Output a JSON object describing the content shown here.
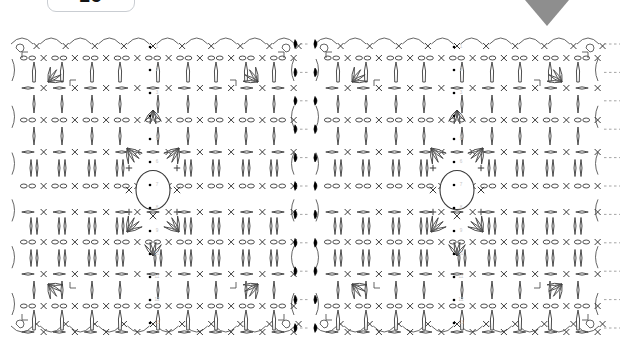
{
  "page": {
    "background_color": "#ffffff",
    "width": 620,
    "height": 343
  },
  "badge": {
    "name": "page-number-badge",
    "value": "25",
    "border_color": "#c9cdd2",
    "text_color": "#141414",
    "clipped_top": true
  },
  "marker": {
    "name": "down-triangle-marker",
    "shape": "triangle-down",
    "color": "#8e8e8e",
    "x": 503,
    "y": -26,
    "width": 88,
    "height": 52
  },
  "chart_data": {
    "type": "diagram",
    "title": "",
    "subtitle": "",
    "stroke_color": "#3a3a3a",
    "fill_color": "#ffffff",
    "accent_color": "#000000",
    "connector_color": "#9a9a9a",
    "row_label_color": "#c6c6c6",
    "panels": [
      {
        "name": "left-motif-panel",
        "x": 8,
        "y": 36,
        "width": 290,
        "height": 300,
        "center": {
          "x": 153,
          "y": 190,
          "ring_radius": 17
        },
        "rows": 13,
        "columns": 13
      },
      {
        "name": "right-motif-panel",
        "x": 312,
        "y": 36,
        "width": 290,
        "height": 300,
        "center": {
          "x": 457,
          "y": 190,
          "ring_radius": 17
        },
        "rows": 13,
        "columns": 13
      }
    ],
    "symbols": [
      {
        "key": "chain",
        "glyph": "oval",
        "label": "ch - chain stitch"
      },
      {
        "key": "single-crochet",
        "glyph": "x",
        "label": "sc - single crochet"
      },
      {
        "key": "slip-stitch",
        "glyph": "filled-dot",
        "label": "sl st - slip stitch"
      },
      {
        "key": "double-crochet",
        "glyph": "vertical-bar",
        "label": "dc - double crochet"
      },
      {
        "key": "treble-crochet",
        "glyph": "long-bar",
        "label": "tr - treble crochet"
      },
      {
        "key": "shell-cluster",
        "glyph": "fan",
        "label": "shell / cluster"
      },
      {
        "key": "picot-loop",
        "glyph": "arc",
        "label": "picot loop"
      },
      {
        "key": "magic-ring",
        "glyph": "circle",
        "label": "ring / centre circle"
      },
      {
        "key": "join-marker",
        "glyph": "corner",
        "label": "row join marker"
      }
    ],
    "row_labels": [
      "1",
      "2",
      "3",
      "4",
      "5",
      "6",
      "7",
      "8",
      "9",
      "10",
      "11",
      "12",
      "13"
    ],
    "legend_position": "none",
    "grid": false
  }
}
